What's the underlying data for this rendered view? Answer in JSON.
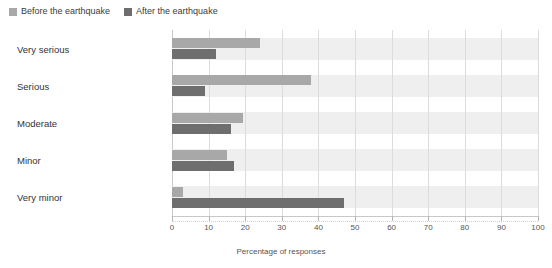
{
  "legend": {
    "position": "top-left",
    "entries": [
      {
        "label": "Before the earthquake",
        "color": "#a8a8a8",
        "icon": "square-swatch"
      },
      {
        "label": "After the earthquake",
        "color": "#6e6e6e",
        "icon": "square-swatch"
      }
    ]
  },
  "axis": {
    "xlabel": "Percentage of responses",
    "ticks": [
      "0",
      "10",
      "20",
      "30",
      "40",
      "50",
      "60",
      "70",
      "80",
      "90",
      "100"
    ]
  },
  "categories": {
    "0": "Very serious",
    "1": "Serious",
    "2": "Moderate",
    "3": "Minor",
    "4": "Very minor"
  },
  "chart_data": {
    "type": "bar",
    "orientation": "horizontal",
    "title": "",
    "xlabel": "Percentage of responses",
    "ylabel": "",
    "xlim": [
      0,
      100
    ],
    "xticks": [
      0,
      10,
      20,
      30,
      40,
      50,
      60,
      70,
      80,
      90,
      100
    ],
    "grid": true,
    "grid_axis": "x",
    "legend_position": "top-left",
    "categories": [
      "Very serious",
      "Serious",
      "Moderate",
      "Minor",
      "Very minor"
    ],
    "series": [
      {
        "name": "Before the earthquake",
        "color": "#a8a8a8",
        "values": [
          24,
          38,
          19.5,
          15,
          3
        ]
      },
      {
        "name": "After the earthquake",
        "color": "#6e6e6e",
        "values": [
          12,
          9,
          16,
          17,
          47
        ]
      }
    ]
  }
}
